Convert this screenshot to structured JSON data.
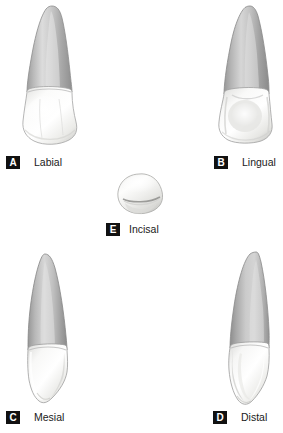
{
  "figure": {
    "background_color": "#ffffff",
    "badge_color": "#111111",
    "badge_text_color": "#ffffff",
    "label_color": "#1a1a1a",
    "root_color_light": "#d8d8d8",
    "root_color_mid": "#b4b4b4",
    "root_color_dark": "#8e8e8e",
    "crown_color_light": "#ffffff",
    "crown_color_mid": "#f0f0ef",
    "crown_color_dark": "#cfcfcd",
    "outline_color": "#9a9a9a"
  },
  "views": [
    {
      "id": "labial",
      "letter": "A",
      "label": "Labial",
      "icon_name": "tooth-labial-view"
    },
    {
      "id": "lingual",
      "letter": "B",
      "label": "Lingual",
      "icon_name": "tooth-lingual-view"
    },
    {
      "id": "incisal",
      "letter": "E",
      "label": "Incisal",
      "icon_name": "tooth-incisal-view"
    },
    {
      "id": "mesial",
      "letter": "C",
      "label": "Mesial",
      "icon_name": "tooth-mesial-view"
    },
    {
      "id": "distal",
      "letter": "D",
      "label": "Distal",
      "icon_name": "tooth-distal-view"
    }
  ]
}
